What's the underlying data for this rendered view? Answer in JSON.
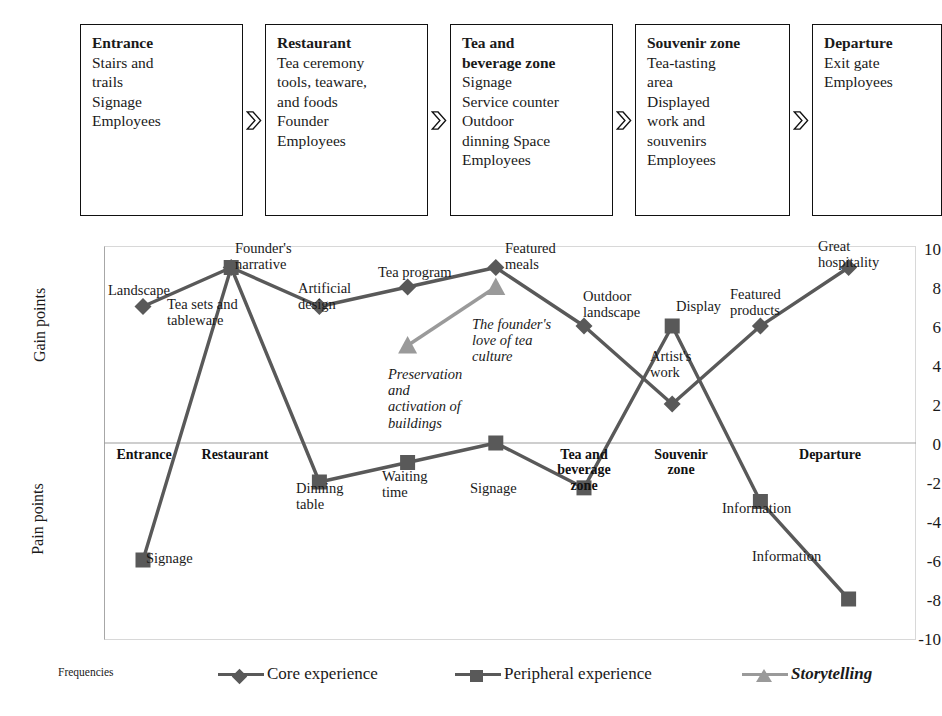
{
  "stages": [
    {
      "title": "Entrance",
      "lines": [
        "Stairs and",
        "trails",
        "Signage",
        "Employees"
      ]
    },
    {
      "title": "Restaurant",
      "lines": [
        "Tea ceremony",
        "tools, teaware,",
        "and foods",
        "Founder",
        "Employees"
      ]
    },
    {
      "title": "Tea and beverage zone",
      "title_lines": [
        "Tea and",
        "beverage zone"
      ],
      "lines": [
        "Signage",
        "Service counter",
        "Outdoor",
        "dinning Space",
        "Employees"
      ]
    },
    {
      "title": "Souvenir zone",
      "lines": [
        "Tea-tasting",
        "area",
        "Displayed",
        "work and",
        "souvenirs",
        "Employees"
      ]
    },
    {
      "title": "Departure",
      "lines": [
        "Exit gate",
        "Employees"
      ]
    }
  ],
  "axes": {
    "y_upper_title": "Gain points",
    "y_lower_title": "Pain points",
    "yticks": [
      "10",
      "8",
      "6",
      "4",
      "2",
      "0",
      "-2",
      "-4",
      "-6",
      "-8",
      "-10"
    ],
    "ymin": -10,
    "ymax": 10
  },
  "stage_axis_labels": [
    {
      "text": "Entrance"
    },
    {
      "text": "Restaurant"
    },
    {
      "text": "Tea and\nbeverage\nzone"
    },
    {
      "text": "Souvenir\nzone"
    },
    {
      "text": "Departure"
    }
  ],
  "legend": {
    "caption": "Frequencies",
    "items": [
      {
        "label": "Core experience",
        "marker": "diamond",
        "color": "#595959",
        "italic": false
      },
      {
        "label": "Peripheral experience",
        "marker": "square",
        "color": "#595959",
        "italic": false
      },
      {
        "label": "Storytelling",
        "marker": "triangle",
        "color": "#9a9a9a",
        "italic": true
      }
    ]
  },
  "chart_data": {
    "type": "line",
    "title": "",
    "xlabel": "",
    "ylabel": "Gain points / Pain points",
    "ylim": [
      -10,
      10
    ],
    "grid": false,
    "legend_position": "bottom",
    "x": [
      1,
      2,
      3,
      4,
      5,
      6,
      7,
      8,
      9
    ],
    "series": [
      {
        "name": "Core experience",
        "marker": "diamond",
        "color": "#595959",
        "values": [
          7,
          9,
          7,
          8,
          9,
          6,
          2,
          6,
          9
        ],
        "point_labels": [
          "Landscape",
          "Founder's\nnarrative",
          "Artificial\ndesign",
          "Tea program",
          "Featured\nmeals",
          "Outdoor\nlandscape",
          "Artist's\nwork",
          "Featured\nproducts",
          "Great\nhospitality"
        ]
      },
      {
        "name": "Peripheral experience",
        "marker": "square",
        "color": "#595959",
        "values": [
          -6,
          9,
          -2,
          -1,
          0,
          -2.3,
          6,
          -3,
          -8
        ],
        "point_labels": [
          "Signage",
          "Tea sets and\ntableware",
          "Dinning\ntable",
          "Waiting\ntime",
          "Signage",
          "",
          "Display",
          "Information",
          "Information"
        ]
      },
      {
        "name": "Storytelling",
        "marker": "triangle",
        "color": "#9a9a9a",
        "x": [
          4,
          5
        ],
        "values": [
          5,
          8
        ],
        "point_labels": [
          "Preservation\nand\nactivation of\nbuildings",
          "The founder's\nlove of tea\nculture"
        ]
      }
    ]
  }
}
